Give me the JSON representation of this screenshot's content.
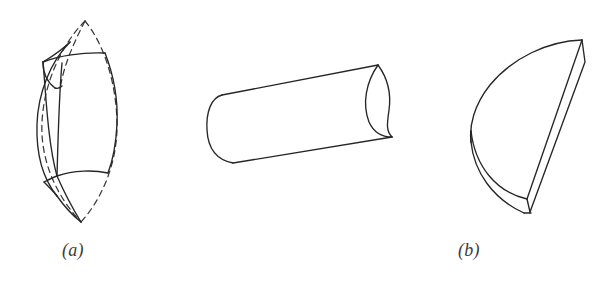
{
  "figure": {
    "background_color": "#ffffff",
    "stroke_color": "#262626",
    "dashed_stroke_color": "#3a3a3a",
    "width": 615,
    "height": 283
  },
  "panels": [
    {
      "id": "a",
      "caption": "(a)",
      "shape_name": "lune-spherical-wedge-shell",
      "description": "Lens / lune shaped solid with pointed top and bottom apexes, a curved band face, and dashed hidden outline arcs"
    },
    {
      "id": "b",
      "caption": "(b)",
      "shape_name": "cylindrical-trough-segment",
      "description": "Cylindrical segment viewed obliquely with a convex left end cap and a concave right end cut"
    },
    {
      "id": "c",
      "caption": "(c)",
      "shape_name": "half-disc-wedge-shell",
      "description": "Half-disc wedge with flat planar face on the right and a thin curved shell rim at the lower left"
    }
  ]
}
